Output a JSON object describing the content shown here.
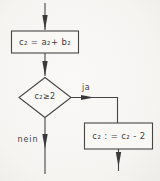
{
  "diagram": {
    "type": "flowchart",
    "language": "de",
    "colors": {
      "background": "#f6f5f2",
      "line": "#454545",
      "text": "#424242"
    },
    "nodes": {
      "assign_box": {
        "shape": "rectangle",
        "label": "c₂ = a₂+ b₂"
      },
      "decision": {
        "shape": "diamond",
        "label": "c₂≥2"
      },
      "decrement_box": {
        "shape": "rectangle",
        "label": "c₂ : = c₂ - 2"
      }
    },
    "edges": {
      "entry": {
        "from": "start",
        "to": "assign_box",
        "label": ""
      },
      "to_decision": {
        "from": "assign_box",
        "to": "decision",
        "label": ""
      },
      "yes_branch": {
        "from": "decision",
        "to": "decrement_box",
        "label": "ja"
      },
      "no_branch": {
        "from": "decision",
        "to": "exit-left",
        "label": "nein"
      },
      "exit_right": {
        "from": "decrement_box",
        "to": "exit-bottom",
        "label": ""
      }
    }
  }
}
